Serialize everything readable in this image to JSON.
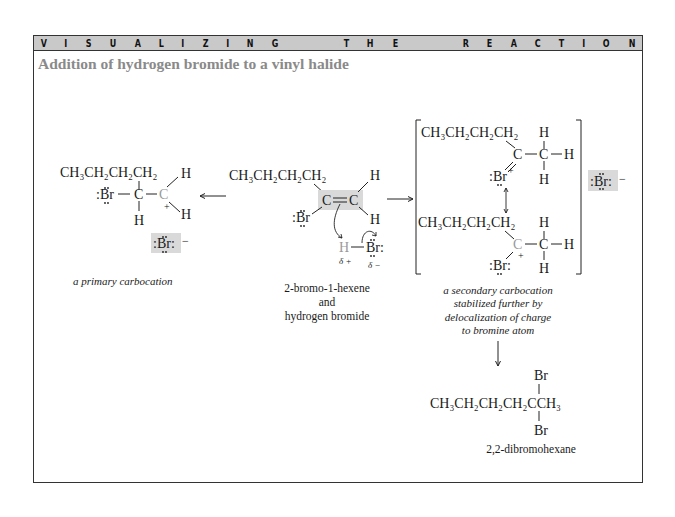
{
  "banner": {
    "words": [
      "VISUALIZING",
      "THE",
      "REACTION"
    ],
    "letters": [
      "V",
      "I",
      "S",
      "U",
      "A",
      "L",
      "I",
      "Z",
      "I",
      "N",
      "G",
      "",
      "T",
      "H",
      "E",
      "",
      "R",
      "E",
      "A",
      "C",
      "T",
      "I",
      "O",
      "N"
    ]
  },
  "subtitle": "Addition of hydrogen bromide to a vinyl halide",
  "structures": {
    "primary_carbocation": {
      "chain": "CH₃CH₂CH₂CH₂",
      "br": ":Br",
      "c1": "C",
      "c2": "C",
      "h_top": "H",
      "h_bottom": "H",
      "h_under": "H",
      "charge": "+",
      "counterion": ":Br:",
      "counterion_charge": "−",
      "caption": "a primary carbocation"
    },
    "reactants": {
      "chain": "CH₃CH₂CH₂CH₂",
      "double_bond": "C═C",
      "br": ":Br",
      "h_top": "H",
      "h_bottom": "H",
      "hbr_h": "H",
      "hbr_br": "Br:",
      "delta_plus": "δ +",
      "delta_minus": "δ −",
      "caption_lines": [
        "2-bromo-1-hexene",
        "and",
        "hydrogen bromide"
      ]
    },
    "secondary_carbocation": {
      "resonance_1": {
        "chain": "CH₃CH₂CH₂CH₂",
        "c": "C",
        "ch": "C",
        "h_top": "H",
        "h_right": "H",
        "h_bottom": "H",
        "br": ":Br",
        "br_charge": "+"
      },
      "resonance_2": {
        "chain": "CH₃CH₂CH₂CH₂",
        "c": "C",
        "ch": "C",
        "h_top": "H",
        "h_right": "H",
        "h_bottom": "H",
        "br": ":Br:",
        "c_charge": "+"
      },
      "counterion": ":Br:",
      "counterion_charge": "−",
      "caption_lines": [
        "a secondary carbocation",
        "stabilized further by",
        "delocalization of charge",
        "to bromine atom"
      ]
    },
    "product": {
      "chain": "CH₃CH₂CH₂CH₂CCH₃",
      "br_top": "Br",
      "br_bottom": "Br",
      "caption": "2,2-dibromohexane"
    }
  },
  "colors": {
    "banner_bg": "#c9c9c9",
    "highlight_bg": "#d9d9d9",
    "subtitle": "#8a8a8a",
    "carbocation_c": "#9a9a9a"
  }
}
